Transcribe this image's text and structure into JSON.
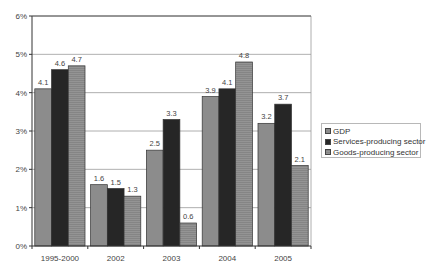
{
  "chart_data": {
    "type": "bar",
    "title": "",
    "xlabel": "",
    "ylabel": "",
    "ylim": [
      0,
      6
    ],
    "y_ticks": [
      "0%",
      "1%",
      "2%",
      "3%",
      "4%",
      "5%",
      "6%"
    ],
    "grid": true,
    "legend_position": "right",
    "categories": [
      "1995-2000",
      "2002",
      "2003",
      "2004",
      "2005"
    ],
    "series": [
      {
        "name": "GDP",
        "color": "#8c8c8c",
        "values": [
          4.1,
          1.6,
          2.5,
          3.9,
          3.2
        ]
      },
      {
        "name": "Services-producing sector",
        "color": "#262626",
        "values": [
          4.6,
          1.5,
          3.3,
          4.1,
          3.7
        ]
      },
      {
        "name": "Goods-producing sector",
        "color": "#939393",
        "values": [
          4.7,
          1.3,
          0.6,
          4.8,
          2.1
        ]
      }
    ],
    "data_labels": [
      [
        "4.1",
        "4.6",
        "4.7"
      ],
      [
        "1.6",
        "1.5",
        "1.3"
      ],
      [
        "2.5",
        "3.3",
        "0.6"
      ],
      [
        "3.9",
        "4.1",
        "4.8"
      ],
      [
        "3.2",
        "3.7",
        "2.1"
      ]
    ]
  },
  "legend": {
    "items": [
      {
        "label": "GDP"
      },
      {
        "label": "Services-producing sector"
      },
      {
        "label": "Goods-producing sector"
      }
    ]
  }
}
